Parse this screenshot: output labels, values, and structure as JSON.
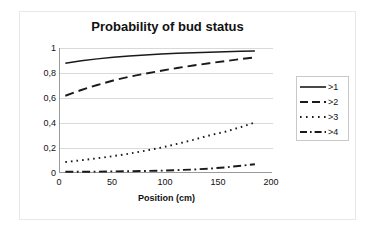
{
  "chart_data": {
    "type": "line",
    "title": "Probability of bud status",
    "xlabel": "Position (cm)",
    "ylabel": "Probability",
    "xlim": [
      0,
      200
    ],
    "ylim": [
      0,
      1
    ],
    "xticks": [
      "0",
      "50",
      "100",
      "150",
      "200"
    ],
    "xtick_values": [
      0,
      50,
      100,
      150,
      200
    ],
    "yticks": [
      "0",
      "0,2",
      "0,4",
      "0,6",
      "0,8",
      "1"
    ],
    "ytick_values": [
      0,
      0.2,
      0.4,
      0.6,
      0.8,
      1
    ],
    "grid": "horizontal",
    "legend_position": "right",
    "x": [
      5,
      20,
      35,
      50,
      65,
      80,
      95,
      110,
      125,
      140,
      155,
      170,
      183
    ],
    "series": [
      {
        "name": ">1",
        "style": "solid",
        "values": [
          0.878,
          0.898,
          0.913,
          0.926,
          0.936,
          0.945,
          0.952,
          0.958,
          0.963,
          0.967,
          0.971,
          0.974,
          0.976
        ]
      },
      {
        "name": ">2",
        "style": "dashed",
        "values": [
          0.618,
          0.664,
          0.704,
          0.74,
          0.77,
          0.795,
          0.818,
          0.84,
          0.86,
          0.878,
          0.895,
          0.912,
          0.925
        ]
      },
      {
        "name": ">3",
        "style": "dotted",
        "values": [
          0.088,
          0.102,
          0.118,
          0.135,
          0.155,
          0.178,
          0.203,
          0.233,
          0.265,
          0.3,
          0.33,
          0.368,
          0.405
        ]
      },
      {
        "name": ">4",
        "style": "dashdot",
        "values": [
          0.01,
          0.01,
          0.011,
          0.013,
          0.014,
          0.016,
          0.019,
          0.023,
          0.028,
          0.035,
          0.045,
          0.058,
          0.07
        ]
      }
    ],
    "colors": {
      "line": "#1a1a1a",
      "axis": "#9a9a9a",
      "grid": "#d9d9d9",
      "background": "#ffffff"
    }
  }
}
